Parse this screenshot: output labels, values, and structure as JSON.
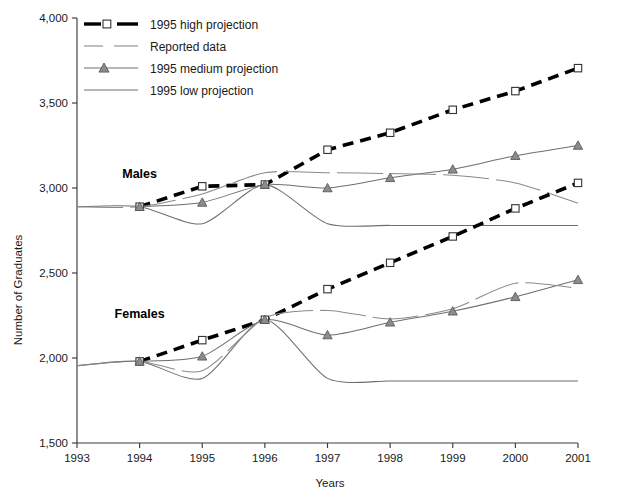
{
  "chart_data": {
    "type": "line",
    "title": "",
    "xlabel": "Years",
    "ylabel": "Number of Graduates",
    "xlim": [
      1993,
      2001
    ],
    "ylim": [
      1500,
      4000
    ],
    "ytick_step": 500,
    "grid": false,
    "legend_position": "top-left",
    "x": [
      1993,
      1994,
      1995,
      1996,
      1997,
      1998,
      1999,
      2000,
      2001
    ],
    "xtick_labels": [
      "1993",
      "1994",
      "1995",
      "1996",
      "1997",
      "1998",
      "1999",
      "2000",
      "2001"
    ],
    "ytick_labels": [
      "1,500",
      "2,000",
      "2,500",
      "3,000",
      "3,500",
      "4,000"
    ],
    "ytick_values": [
      1500,
      2000,
      2500,
      3000,
      3500,
      4000
    ],
    "group_labels": [
      {
        "text": "Males",
        "x": 1994.0,
        "y": 3060
      },
      {
        "text": "Females",
        "x": 1994.0,
        "y": 2235
      }
    ],
    "series": [
      {
        "name": "Males — 1995 high projection",
        "group": "Males",
        "style": "high",
        "marker": "square",
        "x": [
          1994,
          1995,
          1996,
          1997,
          1998,
          1999,
          2000,
          2001
        ],
        "values": [
          2890,
          3010,
          3020,
          3225,
          3325,
          3460,
          3570,
          3705
        ]
      },
      {
        "name": "Males — 1995 medium projection",
        "group": "Males",
        "style": "medium",
        "marker": "triangle",
        "x": [
          1994,
          1995,
          1996,
          1997,
          1998,
          1999,
          2000,
          2001
        ],
        "values": [
          2890,
          2915,
          3020,
          3000,
          3060,
          3110,
          3190,
          3250
        ]
      },
      {
        "name": "Males — 1995 low projection",
        "group": "Males",
        "style": "low",
        "marker": "none",
        "x": [
          1993,
          1994,
          1995,
          1996,
          1997,
          1998,
          1999,
          2000,
          2001
        ],
        "values": [
          2890,
          2890,
          2790,
          3020,
          2790,
          2780,
          2780,
          2780,
          2780
        ]
      },
      {
        "name": "Males — Reported data",
        "group": "Males",
        "style": "reported",
        "marker": "none",
        "x": [
          1993,
          1994,
          1995,
          1996,
          1997,
          1998,
          1999,
          2000,
          2001
        ],
        "values": [
          2890,
          2890,
          2965,
          3090,
          3090,
          3085,
          3075,
          3030,
          2910
        ]
      },
      {
        "name": "Females — 1995 high projection",
        "group": "Females",
        "style": "high",
        "marker": "square",
        "x": [
          1994,
          1995,
          1996,
          1997,
          1998,
          1999,
          2000,
          2001
        ],
        "values": [
          1980,
          2105,
          2225,
          2405,
          2560,
          2715,
          2880,
          3030
        ]
      },
      {
        "name": "Females — 1995 medium projection",
        "group": "Females",
        "style": "medium",
        "marker": "triangle",
        "x": [
          1994,
          1995,
          1996,
          1997,
          1998,
          1999,
          2000,
          2001
        ],
        "values": [
          1980,
          2010,
          2225,
          2135,
          2210,
          2275,
          2360,
          2460
        ]
      },
      {
        "name": "Females — 1995 low projection",
        "group": "Females",
        "style": "low",
        "marker": "none",
        "x": [
          1993,
          1994,
          1995,
          1996,
          1997,
          1998,
          1999,
          2000,
          2001
        ],
        "values": [
          1955,
          1980,
          1880,
          2225,
          1880,
          1865,
          1865,
          1865,
          1865
        ]
      },
      {
        "name": "Females — Reported data",
        "group": "Females",
        "style": "reported",
        "marker": "none",
        "x": [
          1993,
          1994,
          1995,
          1996,
          1997,
          1998,
          1999,
          2000,
          2001
        ],
        "values": [
          1955,
          1980,
          1925,
          2235,
          2280,
          2230,
          2290,
          2440,
          2410
        ]
      }
    ],
    "legend": [
      {
        "label": "1995 high projection",
        "style": "high",
        "marker": "square"
      },
      {
        "label": "Reported data",
        "style": "reported",
        "marker": "none"
      },
      {
        "label": "1995 medium projection",
        "style": "medium",
        "marker": "triangle"
      },
      {
        "label": "1995 low projection",
        "style": "low",
        "marker": "none"
      }
    ]
  }
}
